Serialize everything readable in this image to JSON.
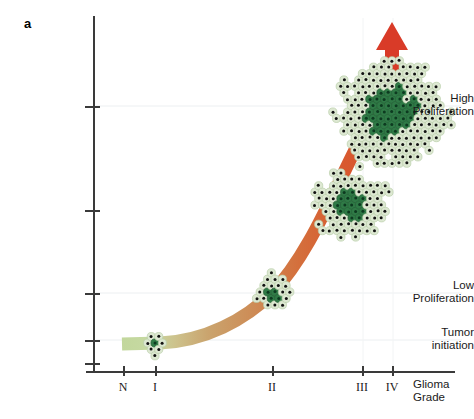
{
  "figure": {
    "panel_label": "a",
    "background": "#ffffff"
  },
  "axes": {
    "y": {
      "ticks": [
        {
          "label": "High\nProliferation",
          "line1": "High",
          "line2": "Proliferation",
          "y": 106
        },
        {
          "label": "",
          "line1": "",
          "line2": "",
          "y": 210
        },
        {
          "label": "Low\nProliferation",
          "line1": "Low",
          "line2": "Proliferation",
          "y": 293
        },
        {
          "label": "Tumor\ninitiation",
          "line1": "Tumor",
          "line2": "initiation",
          "y": 340
        },
        {
          "label": "",
          "line1": "",
          "line2": "",
          "y": 363
        }
      ]
    },
    "x": {
      "title_line1": "Glioma",
      "title_line2": "Grade",
      "ticks": [
        {
          "label": "N",
          "x": 123
        },
        {
          "label": "I",
          "x": 155
        },
        {
          "label": "II",
          "x": 272
        },
        {
          "label": "III",
          "x": 362
        },
        {
          "label": "IV",
          "x": 392
        }
      ]
    }
  },
  "colors": {
    "band_start": "#c5d9a0",
    "band_mid": "#c9a06a",
    "band_end": "#d9522e",
    "arrow": "#d93b28",
    "cell_outer": "#dde8d2",
    "cell_core": "#2f7a46",
    "nucleus": "#111111",
    "axis": "#3a3a3a",
    "gridline": "#eceff1"
  },
  "chart_data": {
    "type": "line",
    "title": "",
    "xlabel": "Glioma Grade",
    "ylabel": "",
    "categories": [
      "N",
      "I",
      "II",
      "III",
      "IV"
    ],
    "ytick_labels": [
      "Tumor initiation",
      "Low Proliferation",
      "High Proliferation"
    ],
    "grid": true,
    "legend": "none",
    "annotations": [
      {
        "name": "growth-arrow",
        "type": "arrow",
        "direction": "up",
        "x": 392,
        "y": 22,
        "color": "#d93b28"
      }
    ],
    "series": [
      {
        "name": "Tumor progression band",
        "description": "Exponentially rising band colored from pale green (normal) through tan to orange-red (high grade)",
        "points": [
          {
            "grade": "N",
            "x": 123,
            "y": 344,
            "level": "Tumor initiation"
          },
          {
            "grade": "I",
            "x": 155,
            "y": 343,
            "level": "Tumor initiation"
          },
          {
            "grade": "II",
            "x": 272,
            "y": 293,
            "level": "Low Proliferation"
          },
          {
            "grade": "III",
            "x": 352,
            "y": 205,
            "level": "intermediate"
          },
          {
            "grade": "IV",
            "x": 392,
            "y": 106,
            "level": "High Proliferation"
          }
        ]
      }
    ],
    "clusters": [
      {
        "name": "cluster-initiation",
        "grade": "I",
        "cx": 155,
        "cy": 343,
        "radius": 12,
        "cell_count": 7,
        "size": "smallest"
      },
      {
        "name": "cluster-low",
        "grade": "II",
        "cx": 275,
        "cy": 292,
        "radius": 17,
        "cell_count": 19,
        "size": "small"
      },
      {
        "name": "cluster-mid",
        "grade": "III",
        "cx": 352,
        "cy": 205,
        "radius": 34,
        "cell_count": 61,
        "size": "medium"
      },
      {
        "name": "cluster-high",
        "grade": "IV",
        "cx": 392,
        "cy": 112,
        "radius": 52,
        "cell_count": 127,
        "size": "large"
      }
    ]
  }
}
